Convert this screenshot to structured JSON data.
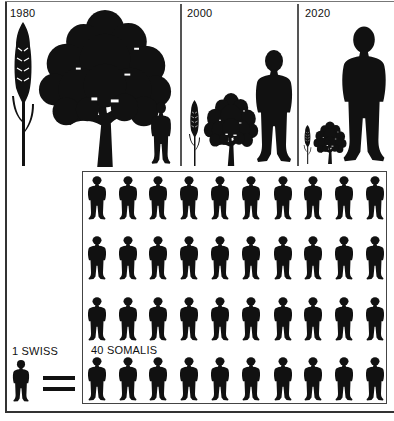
{
  "panels": [
    {
      "year": "1980",
      "wheat": {
        "x": 10,
        "y": 22,
        "w": 26,
        "h": 144
      },
      "tree": {
        "x": 37,
        "y": 8,
        "w": 136,
        "h": 159
      },
      "person": {
        "x": 150,
        "y": 100,
        "w": 22,
        "h": 66
      }
    },
    {
      "year": "2000",
      "wheat": {
        "x": 188,
        "y": 100,
        "w": 13,
        "h": 66
      },
      "tree": {
        "x": 203,
        "y": 92,
        "w": 56,
        "h": 74
      },
      "person": {
        "x": 254,
        "y": 47,
        "w": 40,
        "h": 119
      }
    },
    {
      "year": "2020",
      "wheat": {
        "x": 303,
        "y": 125,
        "w": 9,
        "h": 39
      },
      "tree": {
        "x": 313,
        "y": 121,
        "w": 34,
        "h": 43
      },
      "person": {
        "x": 340,
        "y": 23,
        "w": 48,
        "h": 143
      }
    }
  ],
  "comparison": {
    "left_label": "1 SWISS",
    "right_label": "40 SOMALIS",
    "equals_symbol": "=",
    "grid": {
      "rows": 4,
      "cols": 10,
      "count": 40
    }
  },
  "colors": {
    "ink": "#111111",
    "background": "#ffffff",
    "rule": "#444444"
  }
}
